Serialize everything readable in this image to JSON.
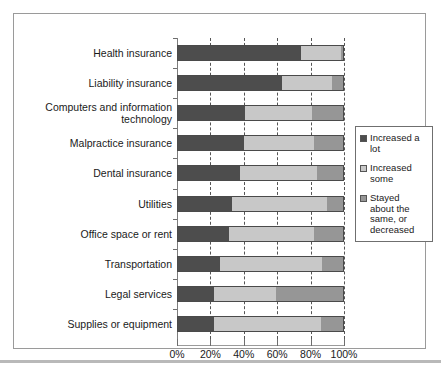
{
  "chart_data": {
    "type": "bar",
    "subtype": "stacked-horizontal-100",
    "title": "",
    "subtitle": "",
    "xlabel": "",
    "ylabel": "",
    "xlim": [
      0,
      100
    ],
    "xticks": [
      "0%",
      "20%",
      "40%",
      "60%",
      "80%",
      "100%"
    ],
    "xtick_values": [
      0,
      20,
      40,
      60,
      80,
      100
    ],
    "grid": true,
    "grid_style": "dashed-vertical",
    "legend_position": "right",
    "categories": [
      "Health insurance",
      "Liability insurance",
      "Computers and information technology",
      "Malpractice insurance",
      "Dental insurance",
      "Utilities",
      "Office space or rent",
      "Transportation",
      "Legal services",
      "Supplies or equipment"
    ],
    "series": [
      {
        "name": "Increased a lot",
        "color": "#4d4d4d",
        "values": [
          74,
          63,
          41,
          40,
          38,
          33,
          31,
          26,
          22,
          22
        ]
      },
      {
        "name": "Increased some",
        "color": "#c8c8c8",
        "values": [
          24,
          30,
          40,
          42,
          46,
          57,
          51,
          61,
          37,
          64
        ]
      },
      {
        "name": "Stayed about the same, or decreased",
        "color": "#969696",
        "values": [
          2,
          7,
          19,
          18,
          16,
          10,
          18,
          13,
          41,
          14
        ]
      }
    ]
  },
  "legend": {
    "entries": [
      {
        "label_line1": "Increased a",
        "label_line2": "lot",
        "color": "#4d4d4d"
      },
      {
        "label_line1": "Increased",
        "label_line2": "some",
        "color": "#c8c8c8"
      },
      {
        "label_line1": "Stayed",
        "label_line2": "about the",
        "label_line3": "same, or",
        "label_line4": "decreased",
        "color": "#969696"
      }
    ]
  },
  "category_labels": [
    {
      "line1": "Health insurance",
      "line2": ""
    },
    {
      "line1": "Liability insurance",
      "line2": ""
    },
    {
      "line1": "Computers and information",
      "line2": "technology"
    },
    {
      "line1": "Malpractice insurance",
      "line2": ""
    },
    {
      "line1": "Dental insurance",
      "line2": ""
    },
    {
      "line1": "Utilities",
      "line2": ""
    },
    {
      "line1": "Office space or rent",
      "line2": ""
    },
    {
      "line1": "Transportation",
      "line2": ""
    },
    {
      "line1": "Legal services",
      "line2": ""
    },
    {
      "line1": "Supplies or equipment",
      "line2": ""
    }
  ]
}
